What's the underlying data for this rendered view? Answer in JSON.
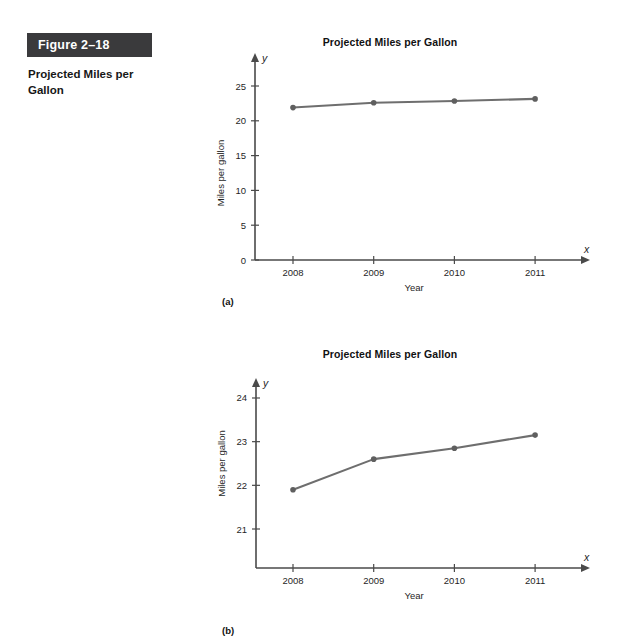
{
  "figure": {
    "number_label": "Figure 2–18",
    "caption": "Projected Miles per Gallon"
  },
  "colors": {
    "figure_bar_bg": "#3a3a3c",
    "series_line": "#6e6e6e",
    "axis": "#4a4a4a",
    "text": "#1a1a1a"
  },
  "panels": {
    "a": {
      "label": "(a)"
    },
    "b": {
      "label": "(b)"
    }
  },
  "chart_data": [
    {
      "type": "line",
      "panel": "(a)",
      "title": "Projected Miles per Gallon",
      "xlabel": "Year",
      "ylabel": "Miles per gallon",
      "x_axis_var": "x",
      "y_axis_var": "y",
      "categories": [
        "2008",
        "2009",
        "2010",
        "2011"
      ],
      "values": [
        21.9,
        22.6,
        22.85,
        23.15
      ],
      "xticks": [
        "2008",
        "2009",
        "2010",
        "2011"
      ],
      "yticks": [
        "0",
        "5",
        "10",
        "15",
        "20",
        "25"
      ],
      "ytick_values": [
        0,
        5,
        10,
        15,
        20,
        25
      ],
      "ylim": [
        0,
        26.5
      ],
      "grid": false,
      "legend": "none",
      "markers": true
    },
    {
      "type": "line",
      "panel": "(b)",
      "title": "Projected Miles per Gallon",
      "xlabel": "Year",
      "ylabel": "Miles per gallon",
      "x_axis_var": "x",
      "y_axis_var": "y",
      "categories": [
        "2008",
        "2009",
        "2010",
        "2011"
      ],
      "values": [
        21.9,
        22.6,
        22.85,
        23.15
      ],
      "xticks": [
        "2008",
        "2009",
        "2010",
        "2011"
      ],
      "yticks": [
        "21",
        "22",
        "23",
        "24"
      ],
      "ytick_values": [
        21,
        22,
        23,
        24
      ],
      "ylim": [
        20.35,
        24.4
      ],
      "grid": false,
      "legend": "none",
      "markers": true
    }
  ]
}
